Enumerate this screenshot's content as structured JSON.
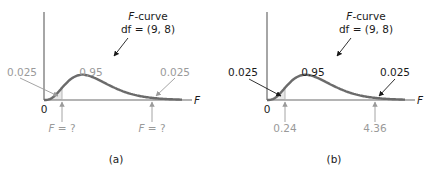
{
  "colors": {
    "curve": "#6b6b6b",
    "axis": "#6b6b6b",
    "shade": "#e8e8e8",
    "gray_text": "#9a9a9a",
    "black_text": "#1a1a1a"
  },
  "panels": [
    {
      "id": "a",
      "caption": "(a)",
      "curve_title_italic": "F",
      "curve_title_rest": "-curve",
      "df_label": "df = (9, 8)",
      "origin_label": "0",
      "axis_label": "F",
      "left_tail_area": "0.025",
      "center_area": "0.95",
      "right_tail_area": "0.025",
      "area_labels_emphasis": "gray",
      "left_critical": {
        "italic": "F",
        "rest": " = ?"
      },
      "right_critical": {
        "italic": "F",
        "rest": " = ?"
      }
    },
    {
      "id": "b",
      "caption": "(b)",
      "curve_title_italic": "F",
      "curve_title_rest": "-curve",
      "df_label": "df = (9, 8)",
      "origin_label": "0",
      "axis_label": "F",
      "left_tail_area": "0.025",
      "center_area": "0.95",
      "right_tail_area": "0.025",
      "area_labels_emphasis": "black",
      "left_critical": {
        "italic": "",
        "rest": "0.24"
      },
      "right_critical": {
        "italic": "",
        "rest": "4.36"
      }
    }
  ]
}
